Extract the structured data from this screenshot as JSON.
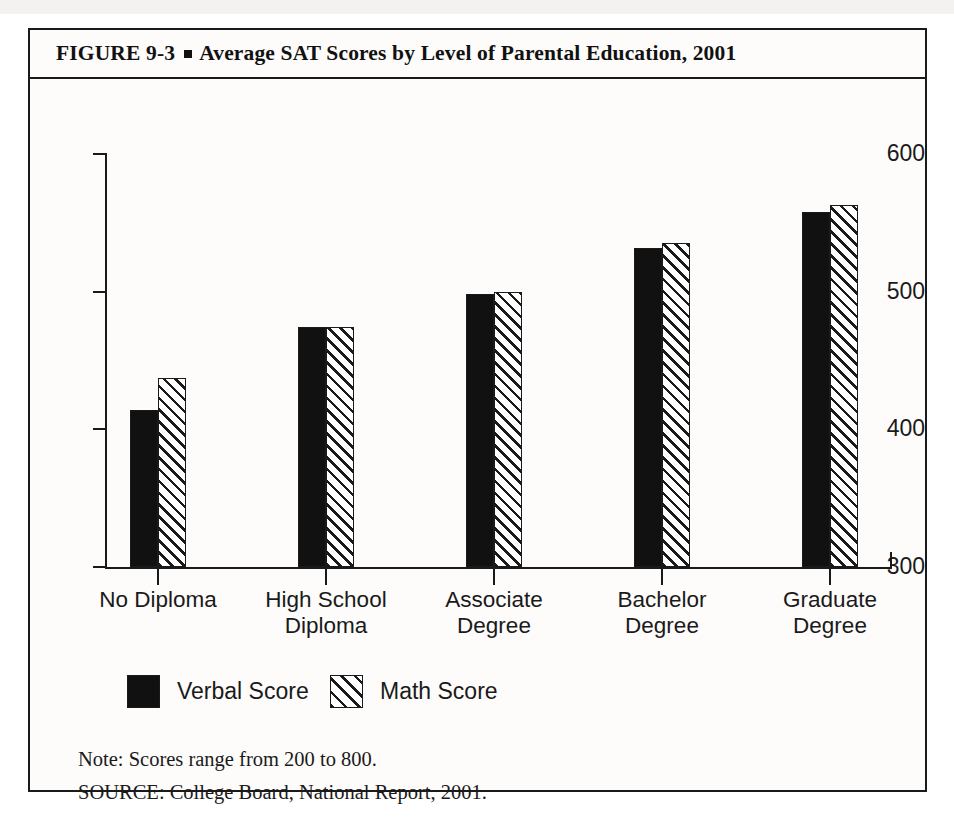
{
  "figure": {
    "number": "FIGURE  9-3",
    "bullet": "square-bullet",
    "title": "Average SAT Scores by Level of Parental Education, 2001"
  },
  "notes": {
    "note": "Note: Scores range from 200 to 800.",
    "source": "SOURCE: College Board, National Report, 2001."
  },
  "chart_data": {
    "type": "bar",
    "title": "Average SAT Scores by Level of Parental Education, 2001",
    "xlabel": "",
    "ylabel": "",
    "ylim": [
      300,
      600
    ],
    "yticks": [
      300,
      400,
      500,
      600
    ],
    "ytick_labels": [
      "300",
      "400",
      "500",
      "600"
    ],
    "grid": false,
    "legend_position": "bottom-left",
    "categories": [
      "No Diploma",
      "High School\nDiploma",
      "Associate\nDegree",
      "Bachelor\nDegree",
      "Graduate\nDegree"
    ],
    "category_lines": [
      [
        "No Diploma"
      ],
      [
        "High School",
        "Diploma"
      ],
      [
        "Associate",
        "Degree"
      ],
      [
        "Bachelor",
        "Degree"
      ],
      [
        "Graduate",
        "Degree"
      ]
    ],
    "series": [
      {
        "name": "Verbal Score",
        "fill": "solid-black",
        "color": "#111111",
        "values": [
          414,
          474,
          498,
          532,
          558
        ]
      },
      {
        "name": "Math Score",
        "fill": "diagonal-hatch",
        "color": "#ffffff",
        "values": [
          437,
          474,
          500,
          535,
          563
        ]
      }
    ]
  },
  "legend": [
    {
      "label": "Verbal Score",
      "swatch": "solid-black"
    },
    {
      "label": "Math Score",
      "swatch": "diagonal-hatch"
    }
  ]
}
